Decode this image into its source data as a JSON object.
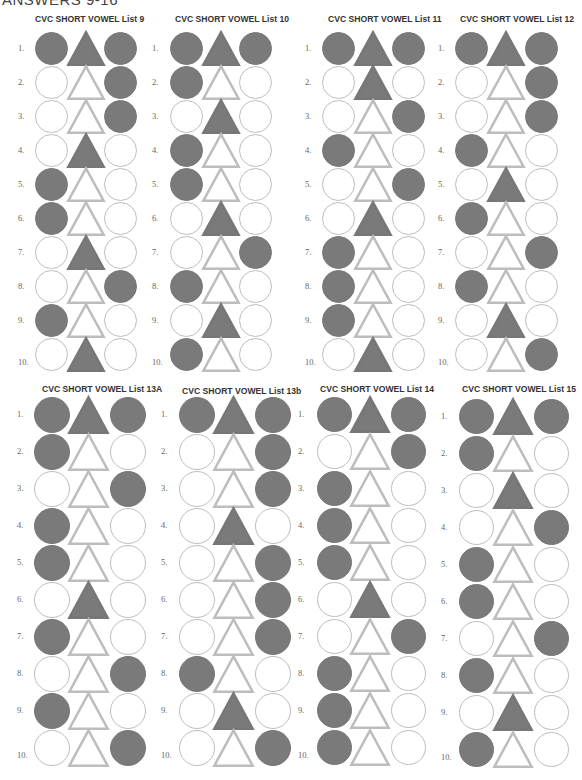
{
  "page": {
    "title": "ANSWERS 9-16"
  },
  "legend": {
    "filled_color": "#7a7a7a",
    "empty_color": "#ffffff",
    "outline_color": "#bdbdbd",
    "shape_order": [
      "circle",
      "triangle",
      "circle"
    ]
  },
  "panels": [
    {
      "title": "CVC SHORT VOWEL List 9",
      "rows": [
        {
          "label": "1.",
          "filled": [
            true,
            true,
            true
          ]
        },
        {
          "label": "2.",
          "filled": [
            false,
            false,
            true
          ]
        },
        {
          "label": "3.",
          "filled": [
            false,
            false,
            true
          ]
        },
        {
          "label": "4.",
          "filled": [
            false,
            true,
            false
          ]
        },
        {
          "label": "5.",
          "filled": [
            true,
            false,
            false
          ]
        },
        {
          "label": "6.",
          "filled": [
            true,
            false,
            false
          ]
        },
        {
          "label": "7.",
          "filled": [
            false,
            true,
            false
          ]
        },
        {
          "label": "8.",
          "filled": [
            false,
            false,
            true
          ]
        },
        {
          "label": "9.",
          "filled": [
            true,
            false,
            false
          ]
        },
        {
          "label": "10.",
          "filled": [
            false,
            true,
            false
          ]
        }
      ]
    },
    {
      "title": "CVC SHORT VOWEL List 10",
      "rows": [
        {
          "label": "1.",
          "filled": [
            true,
            true,
            true
          ]
        },
        {
          "label": "2.",
          "filled": [
            true,
            false,
            false
          ]
        },
        {
          "label": "3.",
          "filled": [
            false,
            true,
            false
          ]
        },
        {
          "label": "4.",
          "filled": [
            true,
            false,
            false
          ]
        },
        {
          "label": "5.",
          "filled": [
            true,
            false,
            false
          ]
        },
        {
          "label": "6.",
          "filled": [
            false,
            true,
            false
          ]
        },
        {
          "label": "7.",
          "filled": [
            false,
            false,
            true
          ]
        },
        {
          "label": "8.",
          "filled": [
            true,
            false,
            false
          ]
        },
        {
          "label": "9.",
          "filled": [
            false,
            true,
            false
          ]
        },
        {
          "label": "10.",
          "filled": [
            true,
            false,
            false
          ]
        }
      ]
    },
    {
      "title": "CVC SHORT VOWEL List 11",
      "rows": [
        {
          "label": "1.",
          "filled": [
            true,
            true,
            true
          ]
        },
        {
          "label": "2.",
          "filled": [
            false,
            true,
            false
          ]
        },
        {
          "label": "3.",
          "filled": [
            false,
            false,
            true
          ]
        },
        {
          "label": "4.",
          "filled": [
            true,
            false,
            false
          ]
        },
        {
          "label": "5.",
          "filled": [
            false,
            false,
            true
          ]
        },
        {
          "label": "6.",
          "filled": [
            false,
            true,
            false
          ]
        },
        {
          "label": "7.",
          "filled": [
            true,
            false,
            false
          ]
        },
        {
          "label": "8.",
          "filled": [
            true,
            false,
            false
          ]
        },
        {
          "label": "9.",
          "filled": [
            true,
            false,
            false
          ]
        },
        {
          "label": "10.",
          "filled": [
            false,
            true,
            false
          ]
        }
      ]
    },
    {
      "title": "CVC SHORT VOWEL List 12",
      "rows": [
        {
          "label": "1.",
          "filled": [
            true,
            true,
            true
          ]
        },
        {
          "label": "2.",
          "filled": [
            false,
            false,
            true
          ]
        },
        {
          "label": "3.",
          "filled": [
            false,
            false,
            true
          ]
        },
        {
          "label": "4.",
          "filled": [
            true,
            false,
            false
          ]
        },
        {
          "label": "5.",
          "filled": [
            false,
            true,
            false
          ]
        },
        {
          "label": "6.",
          "filled": [
            true,
            false,
            false
          ]
        },
        {
          "label": "7.",
          "filled": [
            false,
            false,
            true
          ]
        },
        {
          "label": "8.",
          "filled": [
            true,
            false,
            false
          ]
        },
        {
          "label": "9.",
          "filled": [
            false,
            true,
            false
          ]
        },
        {
          "label": "10.",
          "filled": [
            false,
            false,
            true
          ]
        }
      ]
    },
    {
      "title": "CVC SHORT VOWEL  List 13A",
      "rows": [
        {
          "label": "1.",
          "filled": [
            true,
            true,
            true
          ]
        },
        {
          "label": "2.",
          "filled": [
            true,
            false,
            false
          ]
        },
        {
          "label": "3.",
          "filled": [
            false,
            false,
            true
          ]
        },
        {
          "label": "4.",
          "filled": [
            true,
            false,
            false
          ]
        },
        {
          "label": "5.",
          "filled": [
            true,
            false,
            false
          ]
        },
        {
          "label": "6.",
          "filled": [
            false,
            true,
            false
          ]
        },
        {
          "label": "7.",
          "filled": [
            true,
            false,
            false
          ]
        },
        {
          "label": "8.",
          "filled": [
            false,
            false,
            true
          ]
        },
        {
          "label": "9.",
          "filled": [
            true,
            false,
            false
          ]
        },
        {
          "label": "10.",
          "filled": [
            false,
            false,
            true
          ]
        }
      ]
    },
    {
      "title": "CVC SHORT VOWEL List 13b",
      "rows": [
        {
          "label": "1.",
          "filled": [
            true,
            true,
            true
          ]
        },
        {
          "label": "2.",
          "filled": [
            false,
            false,
            true
          ]
        },
        {
          "label": "3.",
          "filled": [
            false,
            false,
            true
          ]
        },
        {
          "label": "4.",
          "filled": [
            false,
            true,
            false
          ]
        },
        {
          "label": "5.",
          "filled": [
            false,
            false,
            true
          ]
        },
        {
          "label": "6.",
          "filled": [
            false,
            false,
            true
          ]
        },
        {
          "label": "7.",
          "filled": [
            false,
            false,
            true
          ]
        },
        {
          "label": "8.",
          "filled": [
            true,
            false,
            false
          ]
        },
        {
          "label": "9.",
          "filled": [
            false,
            true,
            false
          ]
        },
        {
          "label": "10.",
          "filled": [
            false,
            false,
            true
          ]
        }
      ]
    },
    {
      "title": "CVC SHORT VOWEL List 14",
      "rows": [
        {
          "label": "1.",
          "filled": [
            true,
            true,
            true
          ]
        },
        {
          "label": "2.",
          "filled": [
            false,
            false,
            true
          ]
        },
        {
          "label": "3.",
          "filled": [
            true,
            false,
            false
          ]
        },
        {
          "label": "4.",
          "filled": [
            true,
            false,
            false
          ]
        },
        {
          "label": "5.",
          "filled": [
            true,
            false,
            false
          ]
        },
        {
          "label": "6.",
          "filled": [
            false,
            true,
            false
          ]
        },
        {
          "label": "7.",
          "filled": [
            false,
            false,
            true
          ]
        },
        {
          "label": "8.",
          "filled": [
            true,
            false,
            false
          ]
        },
        {
          "label": "9.",
          "filled": [
            true,
            false,
            false
          ]
        },
        {
          "label": "10.",
          "filled": [
            true,
            false,
            false
          ]
        }
      ]
    },
    {
      "title": "CVC SHORT VOWEL List 15",
      "rows": [
        {
          "label": "1.",
          "filled": [
            true,
            true,
            true
          ]
        },
        {
          "label": "2.",
          "filled": [
            true,
            false,
            false
          ]
        },
        {
          "label": "3.",
          "filled": [
            false,
            true,
            false
          ]
        },
        {
          "label": "4.",
          "filled": [
            false,
            false,
            true
          ]
        },
        {
          "label": "5.",
          "filled": [
            true,
            false,
            false
          ]
        },
        {
          "label": "6.",
          "filled": [
            true,
            false,
            false
          ]
        },
        {
          "label": "7.",
          "filled": [
            false,
            false,
            true
          ]
        },
        {
          "label": "8.",
          "filled": [
            true,
            false,
            false
          ]
        },
        {
          "label": "9.",
          "filled": [
            false,
            true,
            false
          ]
        },
        {
          "label": "10.",
          "filled": [
            true,
            false,
            false
          ]
        }
      ]
    }
  ]
}
